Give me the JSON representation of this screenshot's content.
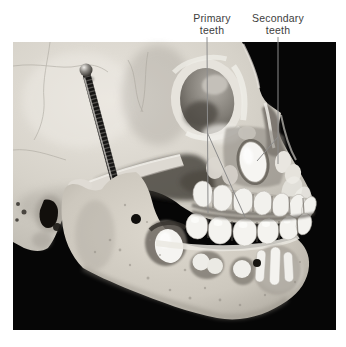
{
  "figure": {
    "labels": {
      "primary": {
        "line1": "Primary",
        "line2": "teeth"
      },
      "secondary": {
        "line1": "Secondary",
        "line2": "teeth"
      }
    },
    "colors": {
      "page_background": "#ffffff",
      "photo_background": "#060606",
      "bone": "#d5d1c8",
      "teeth": "#f3f2ee",
      "label_text": "#3d3d3d",
      "leader_line": "#8c8c8c",
      "spring_metal": "#161514"
    }
  }
}
